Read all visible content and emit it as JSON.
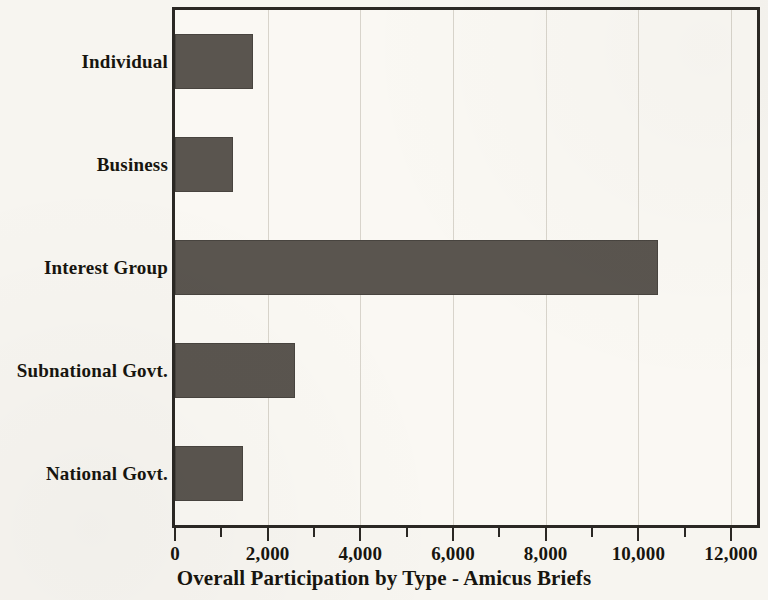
{
  "chart_data": {
    "type": "bar",
    "orientation": "horizontal",
    "title": "",
    "xlabel": "Overall Participation by Type - Amicus Briefs",
    "ylabel": "",
    "categories": [
      "Individual",
      "Business",
      "Interest Group",
      "Subnational Govt.",
      "National Govt."
    ],
    "values": [
      1680,
      1250,
      10420,
      2580,
      1470
    ],
    "series": [
      {
        "name": "Overall Participation by Type - Amicus Briefs",
        "values": [
          1680,
          1250,
          10420,
          2580,
          1470
        ]
      }
    ],
    "xlim": [
      0,
      12560
    ],
    "xtick_values": [
      0,
      2000,
      4000,
      6000,
      8000,
      10000,
      12000
    ],
    "xtick_labels": [
      "0",
      "2,000",
      "4,000",
      "6,000",
      "8,000",
      "10,000",
      "12,000"
    ],
    "minor_tick_values": [
      1000,
      3000,
      5000,
      7000,
      9000,
      11000
    ],
    "gridline_values": [
      2000,
      4000,
      6000,
      8000,
      10000,
      12000
    ],
    "grid": true,
    "grid_axis": "x",
    "legend": false,
    "legend_position": "none",
    "bar_color": "#5a554f",
    "background_color": "#f7f5f0",
    "plot_background_color": "#faf8f3",
    "frame_color": "#2b2824",
    "gridline_color": "#d8d4cb",
    "text_color": "#17150f"
  }
}
